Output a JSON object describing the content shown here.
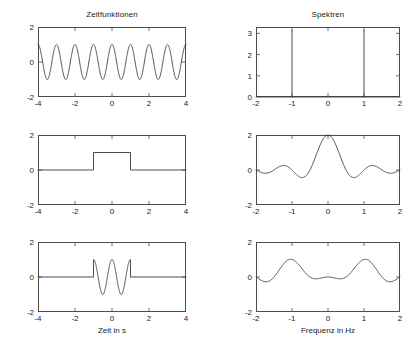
{
  "figure": {
    "width": 419,
    "height": 332,
    "background": "#ffffff",
    "axis_color": "#4d4d4d",
    "curve_color": "#3a3a3a",
    "column_titles": [
      "Zeitfunktionen",
      "Spektren"
    ],
    "xlabels": [
      "Zeit in s",
      "Frequenz in Hz"
    ]
  },
  "chart_data": [
    {
      "type": "line",
      "panel": "top-left",
      "title": "Zeitfunktionen",
      "xlabel": "",
      "ylabel": "",
      "xlim": [
        -4,
        4
      ],
      "ylim": [
        -2,
        2
      ],
      "xticks": [
        -4,
        -2,
        0,
        2,
        4
      ],
      "xticklabels": [
        "-4",
        "-2",
        "0",
        "2",
        "4"
      ],
      "yticks": [
        -2,
        0,
        2
      ],
      "yticklabels": [
        "-2",
        "0",
        "2"
      ],
      "grid": false,
      "legend": "none",
      "description": "cos(2*pi*1*t), amplitude 1, frequency 1 Hz",
      "series": [
        {
          "name": "cos(2 pi t)",
          "function": "cos",
          "amplitude": 1,
          "frequency_hz": 1,
          "x_start": -4,
          "x_end": 4,
          "samples": 801
        }
      ]
    },
    {
      "type": "line",
      "panel": "top-right",
      "title": "Spektren",
      "xlabel": "",
      "ylabel": "",
      "xlim": [
        -2,
        2
      ],
      "ylim": [
        0,
        3.3
      ],
      "xticks": [
        -2,
        -1,
        0,
        1,
        2
      ],
      "xticklabels": [
        "-2",
        "-1",
        "0",
        "1",
        "2"
      ],
      "yticks": [
        0,
        1,
        2,
        3
      ],
      "yticklabels": [
        "0",
        "1",
        "2",
        "3"
      ],
      "grid": false,
      "legend": "none",
      "description": "Two Dirac impulses at -1 Hz and +1 Hz of weight pi",
      "impulses": [
        {
          "x": -1,
          "height": 3.14
        },
        {
          "x": 1,
          "height": 3.14
        }
      ],
      "baseline": 0
    },
    {
      "type": "line",
      "panel": "middle-left",
      "title": "",
      "xlabel": "",
      "ylabel": "",
      "xlim": [
        -4,
        4
      ],
      "ylim": [
        -2,
        2
      ],
      "xticks": [
        -4,
        -2,
        0,
        2,
        4
      ],
      "xticklabels": [
        "-4",
        "-2",
        "0",
        "2",
        "4"
      ],
      "yticks": [
        -2,
        0,
        2
      ],
      "yticklabels": [
        "-2",
        "0",
        "2"
      ],
      "grid": false,
      "legend": "none",
      "description": "Rectangular pulse rect(t/2): value 1 for |t| < 1, else 0",
      "series": [
        {
          "name": "rect(t/2)",
          "function": "rect",
          "amplitude": 1,
          "half_width": 1,
          "points": [
            [
              -4,
              0
            ],
            [
              -1,
              0
            ],
            [
              -1,
              1
            ],
            [
              1,
              1
            ],
            [
              1,
              0
            ],
            [
              4,
              0
            ]
          ]
        }
      ]
    },
    {
      "type": "line",
      "panel": "middle-right",
      "title": "",
      "xlabel": "",
      "ylabel": "",
      "xlim": [
        -2,
        2
      ],
      "ylim": [
        -2,
        2
      ],
      "xticks": [
        -2,
        -1,
        0,
        1,
        2
      ],
      "xticklabels": [
        "-2",
        "-1",
        "0",
        "1",
        "2"
      ],
      "yticks": [
        -2,
        0,
        2
      ],
      "yticklabels": [
        "-2",
        "0",
        "2"
      ],
      "grid": false,
      "legend": "none",
      "description": "2*sinc(2f) = sin(2 pi f)/(pi f); peak 2 at f = 0, zeros at multiples of 0.5",
      "series": [
        {
          "name": "2 sinc(2f)",
          "function": "sinc",
          "peak": 2,
          "first_zero": 0.5,
          "x_start": -2,
          "x_end": 2,
          "samples": 401
        }
      ]
    },
    {
      "type": "line",
      "panel": "bottom-left",
      "title": "",
      "xlabel": "Zeit in s",
      "ylabel": "",
      "xlim": [
        -4,
        4
      ],
      "ylim": [
        -2,
        2
      ],
      "xticks": [
        -4,
        -2,
        0,
        2,
        4
      ],
      "xticklabels": [
        "-4",
        "-2",
        "0",
        "2",
        "4"
      ],
      "yticks": [
        -2,
        0,
        2
      ],
      "yticklabels": [
        "-2",
        "0",
        "2"
      ],
      "grid": false,
      "legend": "none",
      "description": "cos(2 pi t) windowed by rect(t/2): product of the two signals above",
      "series": [
        {
          "name": "cos(2 pi t) * rect(t/2)",
          "function": "windowed-cos",
          "amplitude": 1,
          "frequency_hz": 1,
          "window_half_width": 1,
          "x_start": -4,
          "x_end": 4,
          "samples": 801
        }
      ]
    },
    {
      "type": "line",
      "panel": "bottom-right",
      "title": "",
      "xlabel": "Frequenz in Hz",
      "ylabel": "",
      "xlim": [
        -2,
        2
      ],
      "ylim": [
        -2,
        2
      ],
      "xticks": [
        -2,
        -1,
        0,
        1,
        2
      ],
      "xticklabels": [
        "-2",
        "-1",
        "0",
        "1",
        "2"
      ],
      "yticks": [
        -2,
        0,
        2
      ],
      "yticklabels": [
        "-2",
        "0",
        "2"
      ],
      "grid": false,
      "legend": "none",
      "description": "sinc(2(f+1)) + sinc(2(f-1)): two sinc lobes of height 1 centred at -1 Hz and +1 Hz",
      "series": [
        {
          "name": "sinc(2(f+1)) + sinc(2(f-1))",
          "function": "sinc-pair",
          "peak": 1,
          "centers": [
            -1,
            1
          ],
          "first_zero": 0.5,
          "x_start": -2,
          "x_end": 2,
          "samples": 401
        }
      ]
    }
  ]
}
